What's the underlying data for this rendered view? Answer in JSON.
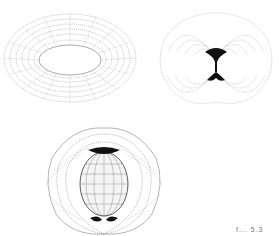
{
  "figure": {
    "panels": [
      {
        "id": "a",
        "description": "Wireframe torus (ring surface)",
        "stroke": "#888888"
      },
      {
        "id": "b",
        "description": "Cutaway surface with concentric field lines and dark cusp at center",
        "stroke": "#999999",
        "cusp_color": "#111111"
      },
      {
        "id": "c",
        "description": "Nested surfaces: outer cutaway shell with inner ellipsoid",
        "stroke": "#666666",
        "cusp_color": "#111111"
      }
    ],
    "caption_fragment": "f... 5.3"
  }
}
